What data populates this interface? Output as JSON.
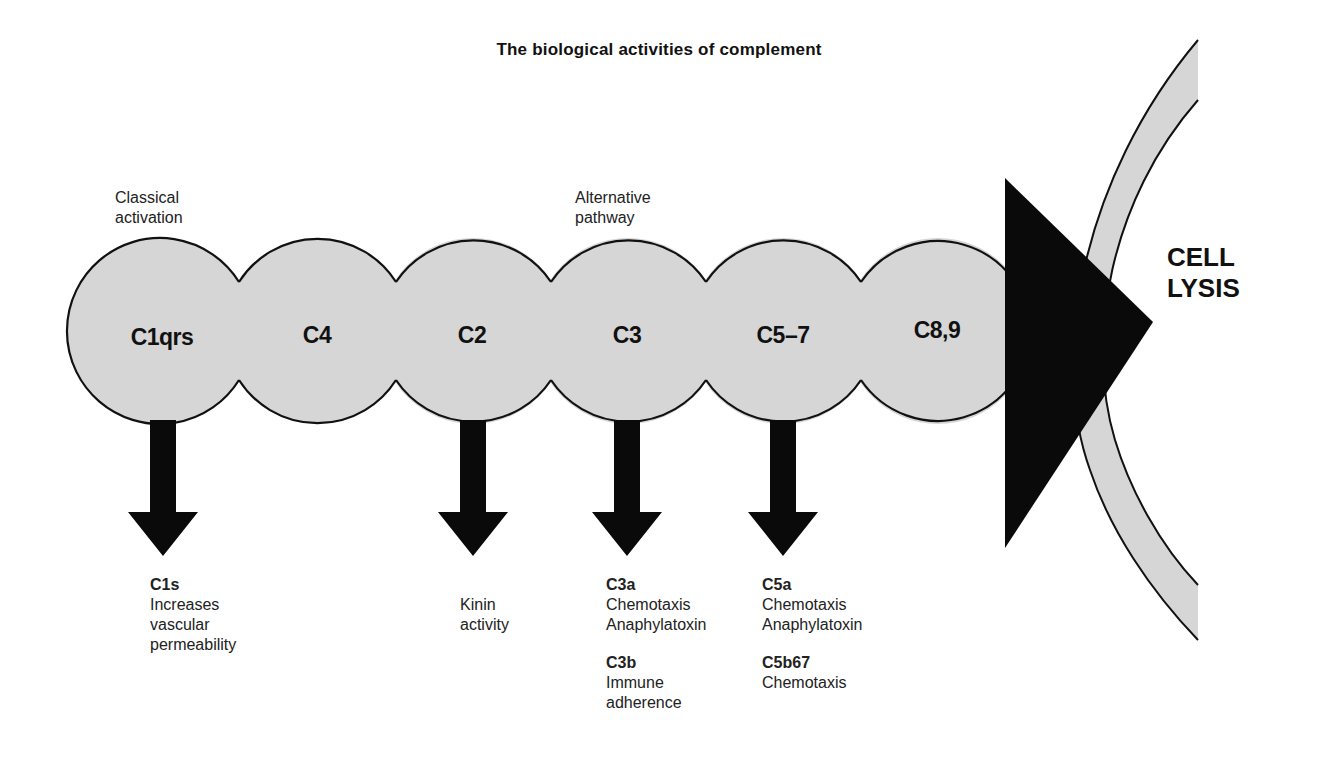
{
  "title": "The biological activities of complement",
  "annotations": {
    "classical": "Classical\nactivation",
    "alternative": "Alternative\npathway"
  },
  "components": [
    {
      "id": "c1qrs",
      "label": "C1qrs",
      "cx": 160
    },
    {
      "id": "c4",
      "label": "C4",
      "cx": 318
    },
    {
      "id": "c2",
      "label": "C2",
      "cx": 473
    },
    {
      "id": "c3",
      "label": "C3",
      "cx": 628
    },
    {
      "id": "c5-7",
      "label": "C5–7",
      "cx": 783
    },
    {
      "id": "c8-9",
      "label": "C8,9",
      "cx": 938
    }
  ],
  "end_label": "CELL\nLYSIS",
  "products": {
    "c1": [
      {
        "name": "C1s",
        "desc": "Increases\nvascular\npermeability"
      }
    ],
    "c2": [
      {
        "name": "",
        "desc": "Kinin\nactivity"
      }
    ],
    "c3": [
      {
        "name": "C3a",
        "desc": "Chemotaxis\nAnaphylatoxin"
      },
      {
        "name": "C3b",
        "desc": "Immune\nadherence"
      }
    ],
    "c5": [
      {
        "name": "C5a",
        "desc": "Chemotaxis\nAnaphylatoxin"
      },
      {
        "name": "C5b67",
        "desc": "Chemotaxis"
      }
    ]
  },
  "colors": {
    "circle_fill": "#d6d6d6",
    "outline": "#111111",
    "arrow": "#0a0a0a",
    "membrane_fill": "#d6d6d6"
  }
}
